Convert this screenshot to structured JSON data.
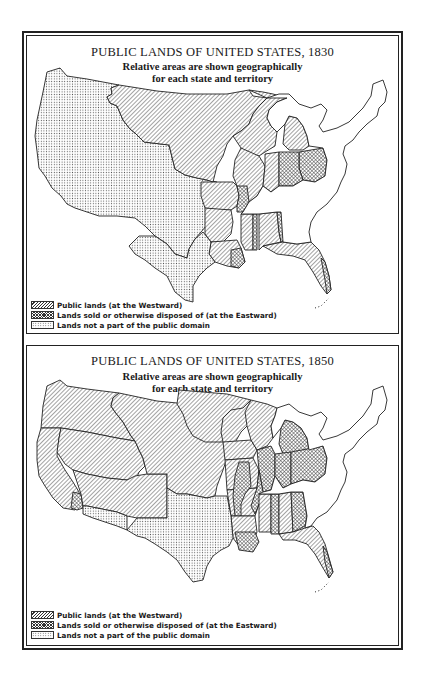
{
  "maps": [
    {
      "id": "map-1830",
      "title": "PUBLIC LANDS OF UNITED STATES, 1830",
      "subtitle_line1": "Relative areas are shown geographically",
      "subtitle_line2": "for each state and territory",
      "legend": [
        {
          "key": "public",
          "label": "Public lands (at the Westward)"
        },
        {
          "key": "disposed",
          "label": "Lands sold or otherwise disposed of (at the Eastward)"
        },
        {
          "key": "not_public",
          "label": "Lands not a part of the public domain"
        }
      ]
    },
    {
      "id": "map-1850",
      "title": "PUBLIC LANDS OF UNITED STATES, 1850",
      "subtitle_line1": "Relative areas are shown geographically",
      "subtitle_line2": "for each state and territory",
      "legend": [
        {
          "key": "public",
          "label": "Public lands (at the Westward)"
        },
        {
          "key": "disposed",
          "label": "Lands sold or otherwise disposed of (at the Eastward)"
        },
        {
          "key": "not_public",
          "label": "Lands not a part of the public domain"
        }
      ]
    }
  ],
  "patterns": {
    "public": "diagonal-hatch",
    "disposed": "cross-hatch",
    "not_public": "stipple-dots"
  },
  "colors": {
    "ink": "#222222",
    "paper": "#ffffff"
  }
}
